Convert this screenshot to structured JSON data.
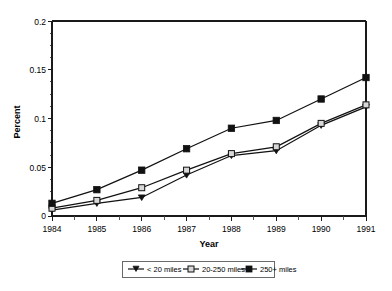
{
  "chart_data": {
    "type": "line",
    "title": "",
    "xlabel": "Year",
    "ylabel": "Percent",
    "categories": [
      "1984",
      "1985",
      "1986",
      "1987",
      "1988",
      "1989",
      "1990",
      "1991"
    ],
    "x": [
      1984,
      1985,
      1986,
      1987,
      1988,
      1989,
      1990,
      1991
    ],
    "xlim": [
      1984,
      1991
    ],
    "ylim": [
      0,
      0.2
    ],
    "ytick_labels": [
      "0",
      "0.05",
      "0.1",
      "0.15",
      "0.2"
    ],
    "yticks": [
      0,
      0.05,
      0.1,
      0.15,
      0.2
    ],
    "y_minor_tick_step": 0.0125,
    "grid": false,
    "legend_position": "bottom",
    "series": [
      {
        "name": "< 20 miles",
        "marker": "triangle-down-filled",
        "values": [
          0.006,
          0.013,
          0.019,
          0.042,
          0.062,
          0.067,
          0.093,
          0.112
        ]
      },
      {
        "name": "20-250 miles",
        "marker": "square-open",
        "values": [
          0.008,
          0.016,
          0.029,
          0.047,
          0.064,
          0.071,
          0.095,
          0.114
        ]
      },
      {
        "name": "250+ miles",
        "marker": "square-filled",
        "values": [
          0.013,
          0.027,
          0.047,
          0.069,
          0.09,
          0.098,
          0.12,
          0.142
        ]
      }
    ]
  },
  "axes": {
    "y_title": "Percent",
    "x_title": "Year"
  },
  "legend": {
    "items": [
      {
        "label": "< 20 miles"
      },
      {
        "label": "20-250 miles"
      },
      {
        "label": "250+ miles"
      }
    ]
  },
  "colors": {
    "line": "#111111",
    "marker_filled": "#111111",
    "marker_open_fill": "#d8d8d8",
    "axis": "#1a1a1a",
    "background": "#ffffff",
    "legend_border": "#5a5a5a"
  }
}
